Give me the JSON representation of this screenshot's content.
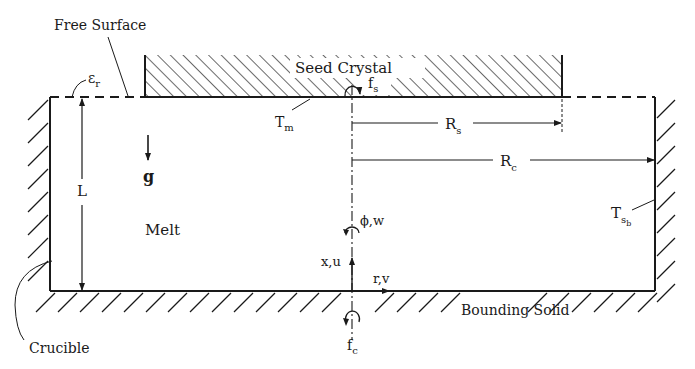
{
  "figure": {
    "type": "czochralski-crystal-growth-schematic",
    "labels": {
      "free_surface": "Free Surface",
      "emissivity": "ε",
      "emissivity_sub": "r",
      "seed_crystal": "Seed Crystal",
      "seed_rotation": "f",
      "seed_rotation_sub": "s",
      "melt_temp": "T",
      "melt_temp_sub": "m",
      "seed_radius": "R",
      "seed_radius_sub": "s",
      "crucible_radius": "R",
      "crucible_radius_sub": "c",
      "gravity": "g",
      "depth": "L",
      "melt": "Melt",
      "azimuthal": "ϕ,w",
      "axial": "x,u",
      "radial": "r,v",
      "wall_temp": "T",
      "wall_temp_sub": "s",
      "wall_temp_subsub": "b",
      "bounding_solid": "Bounding Solid",
      "crucible_rotation": "f",
      "crucible_rotation_sub": "c",
      "crucible": "Crucible"
    },
    "colors": {
      "ink": "#1a1a1a",
      "background": "#ffffff"
    }
  }
}
